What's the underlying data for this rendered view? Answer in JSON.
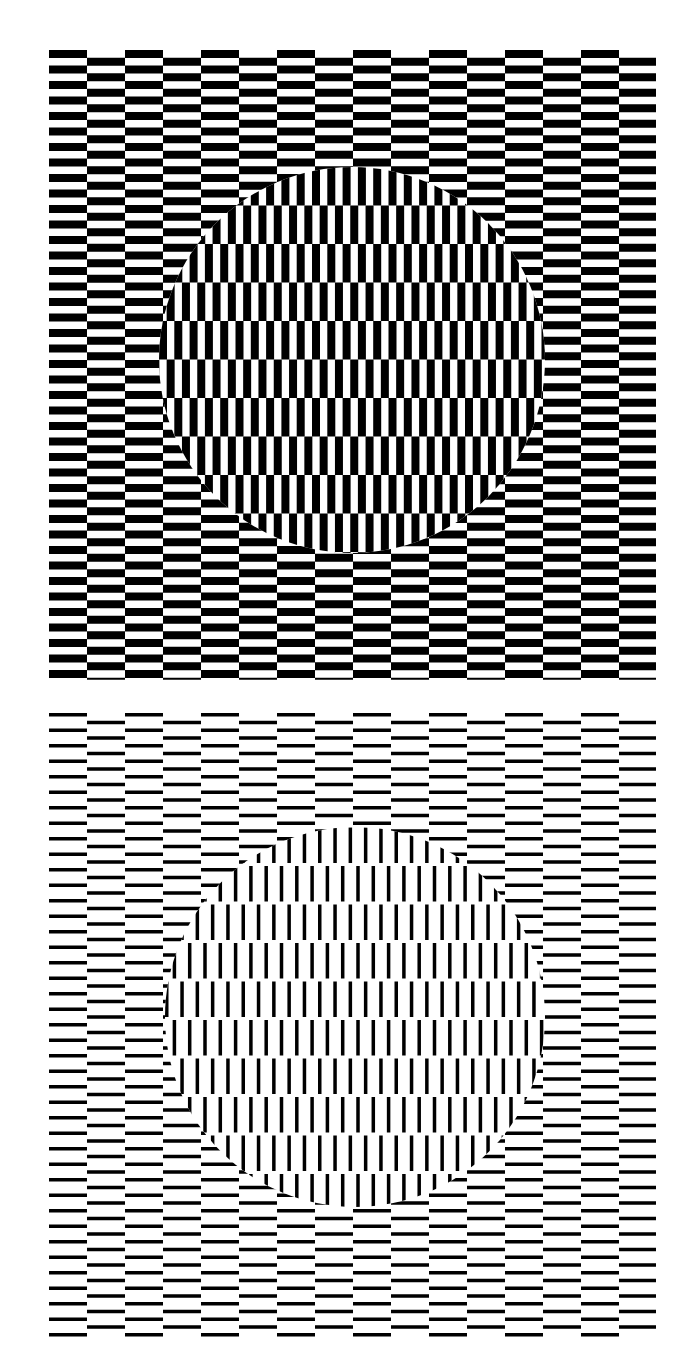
{
  "figure": {
    "background": "#ffffff",
    "ink": "#000000",
    "panels": [
      {
        "id": "top",
        "variant": "thick-bars",
        "field": {
          "x": 49,
          "y": 48,
          "width": 607,
          "height": 624
        },
        "tile": {
          "column_width": 38,
          "period": 15.5,
          "bar_thickness": 8,
          "first_bar_offset": 2
        },
        "disc": {
          "cx": 352,
          "cy": 360,
          "r": 193,
          "row_height": 38.5,
          "row_origin_y": 167,
          "stripe_period": 15.3,
          "stripe_thickness": 8
        }
      },
      {
        "id": "bottom",
        "variant": "thin-lines",
        "field": {
          "x": 49,
          "y": 710,
          "width": 607,
          "height": 622
        },
        "tile": {
          "column_width": 38,
          "period": 15.5,
          "bar_thickness": 3.5,
          "first_bar_offset": 3
        },
        "disc": {
          "cx": 355,
          "cy": 1017,
          "r": 190,
          "row_height": 38.5,
          "row_origin_y": 826,
          "stripe_period": 15.3,
          "stripe_thickness": 3.5
        }
      }
    ]
  }
}
